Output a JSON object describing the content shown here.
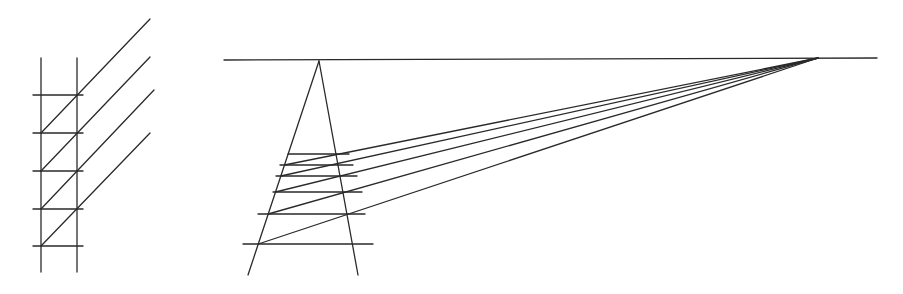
{
  "figure": {
    "title": "",
    "stroke_color": "#2a2a2a",
    "background": "#ffffff"
  },
  "left_diagram": {
    "description": "Ladder with parallel diagonals",
    "verticals": [
      {
        "x1": 41,
        "y1": 58,
        "x2": 41,
        "y2": 272
      },
      {
        "x1": 77,
        "y1": 58,
        "x2": 77,
        "y2": 272
      }
    ],
    "rungs": [
      {
        "x1": 33,
        "y1": 95,
        "x2": 83,
        "y2": 95
      },
      {
        "x1": 33,
        "y1": 133,
        "x2": 83,
        "y2": 133
      },
      {
        "x1": 33,
        "y1": 171,
        "x2": 83,
        "y2": 171
      },
      {
        "x1": 33,
        "y1": 209,
        "x2": 83,
        "y2": 209
      },
      {
        "x1": 33,
        "y1": 246,
        "x2": 83,
        "y2": 246
      }
    ],
    "diagonals": [
      {
        "x1": 41,
        "y1": 133,
        "x2": 150,
        "y2": 19
      },
      {
        "x1": 41,
        "y1": 171,
        "x2": 150,
        "y2": 57
      },
      {
        "x1": 41,
        "y1": 209,
        "x2": 154,
        "y2": 90
      },
      {
        "x1": 41,
        "y1": 246,
        "x2": 150,
        "y2": 133
      }
    ]
  },
  "right_diagram": {
    "description": "Ladder in perspective with lines converging to a vanishing point on the horizon",
    "horizon": {
      "x1": 224,
      "y1": 60,
      "x2": 877,
      "y2": 58
    },
    "apex": {
      "x": 319,
      "y": 61
    },
    "vanishing_point": {
      "x": 818,
      "y": 58
    },
    "legs": [
      {
        "x1": 319,
        "y1": 61,
        "x2": 248,
        "y2": 275
      },
      {
        "x1": 319,
        "y1": 61,
        "x2": 358,
        "y2": 275
      }
    ],
    "rungs": [
      {
        "x1": 288,
        "y1": 154,
        "x2": 349,
        "y2": 154
      },
      {
        "x1": 280,
        "y1": 165,
        "x2": 353,
        "y2": 165
      },
      {
        "x1": 276,
        "y1": 176,
        "x2": 357,
        "y2": 176
      },
      {
        "x1": 273,
        "y1": 192,
        "x2": 362,
        "y2": 192
      },
      {
        "x1": 258,
        "y1": 214,
        "x2": 365,
        "y2": 214
      },
      {
        "x1": 243,
        "y1": 244,
        "x2": 373,
        "y2": 244
      }
    ],
    "converging_lines": [
      {
        "x1": 284.5,
        "y1": 165,
        "x2": 818,
        "y2": 58
      },
      {
        "x1": 280.8,
        "y1": 176,
        "x2": 818,
        "y2": 58
      },
      {
        "x1": 275.5,
        "y1": 192,
        "x2": 818,
        "y2": 58
      },
      {
        "x1": 268.2,
        "y1": 214,
        "x2": 818,
        "y2": 58
      },
      {
        "x1": 258.3,
        "y1": 244,
        "x2": 818,
        "y2": 58
      }
    ]
  }
}
